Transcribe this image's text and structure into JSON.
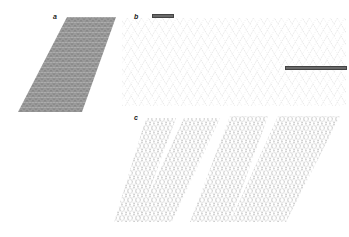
{
  "figure": {
    "panels": [
      {
        "id": "a",
        "label": "a",
        "description": "dense lattice parallelogram",
        "color": "#8c8c8c"
      },
      {
        "id": "b",
        "label": "b",
        "description": "sparse crossover lattice with scale bars",
        "color": "#bdbdbd"
      },
      {
        "id": "c",
        "label": "c",
        "description": "four tilted crossover lattice strips",
        "color": "#9a9a9a"
      }
    ],
    "scale_bars": [
      {
        "panel": "b",
        "position": "top-left",
        "color": "#6a6a6a"
      },
      {
        "panel": "b",
        "position": "right",
        "color": "#6a6a6a"
      }
    ]
  }
}
